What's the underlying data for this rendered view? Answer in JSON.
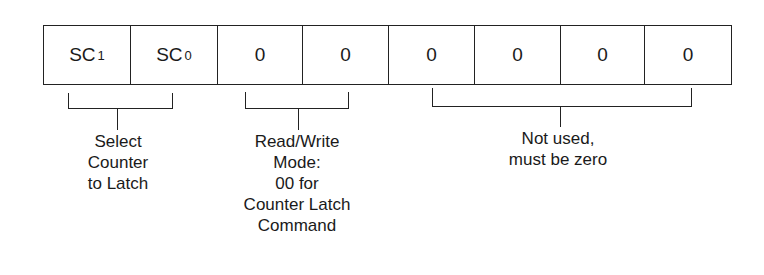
{
  "register": {
    "cells": [
      {
        "main": "SC",
        "sub": "1"
      },
      {
        "main": "SC",
        "sub": "0"
      },
      {
        "main": "0",
        "sub": ""
      },
      {
        "main": "0",
        "sub": ""
      },
      {
        "main": "0",
        "sub": ""
      },
      {
        "main": "0",
        "sub": ""
      },
      {
        "main": "0",
        "sub": ""
      },
      {
        "main": "0",
        "sub": ""
      }
    ]
  },
  "groups": {
    "select_counter": {
      "lines": [
        "Select",
        "Counter",
        "to Latch"
      ]
    },
    "read_write_mode": {
      "lines": [
        "Read/Write",
        "Mode:",
        "00 for",
        "Counter Latch",
        "Command"
      ]
    },
    "not_used": {
      "lines": [
        "Not used,",
        "must be zero"
      ]
    }
  }
}
